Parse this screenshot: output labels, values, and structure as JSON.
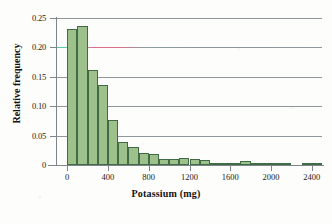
{
  "chart_data": {
    "type": "bar",
    "title": "",
    "subtitle": "",
    "xlabel": "Potassium (mg)",
    "ylabel": "Relative frequency",
    "xlim": [
      -100,
      2500
    ],
    "ylim": [
      0,
      0.25
    ],
    "grid": "horizontal",
    "legend": "none",
    "bin_width": 100,
    "xticks": [
      "0",
      "400",
      "800",
      "1200",
      "1600",
      "2000",
      "2400"
    ],
    "xtick_values": [
      0,
      400,
      800,
      1200,
      1600,
      2000,
      2400
    ],
    "yticks": [
      "0",
      "0.05",
      "0.10",
      "0.15",
      "0.20",
      "0.25"
    ],
    "ytick_values": [
      0,
      0.05,
      0.1,
      0.15,
      0.2,
      0.25
    ],
    "bin_starts": [
      0,
      100,
      200,
      300,
      400,
      500,
      600,
      700,
      800,
      900,
      1000,
      1100,
      1200,
      1300,
      1400,
      1500,
      1600,
      1700,
      1800,
      1900,
      2000,
      2100,
      2300,
      2400
    ],
    "categories": [
      "0-100",
      "100-200",
      "200-300",
      "300-400",
      "400-500",
      "500-600",
      "600-700",
      "700-800",
      "800-900",
      "900-1000",
      "1000-1100",
      "1100-1200",
      "1200-1300",
      "1300-1400",
      "1400-1500",
      "1500-1600",
      "1600-1700",
      "1700-1800",
      "1800-1900",
      "1900-2000",
      "2000-2100",
      "2100-2200",
      "2300-2400",
      "2400-2500"
    ],
    "values": [
      0.232,
      0.236,
      0.161,
      0.136,
      0.077,
      0.039,
      0.031,
      0.021,
      0.018,
      0.01,
      0.011,
      0.012,
      0.01,
      0.009,
      0.004,
      0.004,
      0.004,
      0.006,
      0.002,
      0.002,
      0.002,
      0.003,
      0.002,
      0.003
    ],
    "bar_color": "#9ec08a",
    "bar_edge_color": "#3f6b47",
    "gridline_color": "#8f969c",
    "axis_color": "#7d858c"
  }
}
